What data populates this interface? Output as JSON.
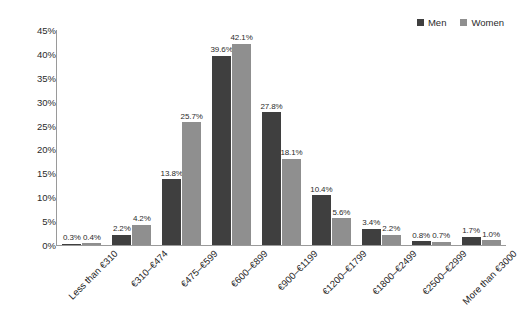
{
  "legend": {
    "position": "top-right",
    "items": [
      {
        "label": "Men",
        "color": "#3f3f3f",
        "swatch_name": "legend-swatch-men"
      },
      {
        "label": "Women",
        "color": "#8f8f8f",
        "swatch_name": "legend-swatch-women"
      }
    ]
  },
  "axis": {
    "y_ticks": [
      "0%",
      "5%",
      "10%",
      "15%",
      "20%",
      "25%",
      "30%",
      "35%",
      "40%",
      "45%"
    ],
    "y_tick_values": [
      0,
      5,
      10,
      15,
      20,
      25,
      30,
      35,
      40,
      45
    ]
  },
  "chart_data": {
    "type": "bar",
    "title": "",
    "subtitle": "",
    "xlabel": "",
    "ylabel": "",
    "ylim": [
      0,
      45
    ],
    "grid": false,
    "legend_position": "top-right",
    "categories": [
      "Less than €310",
      "€310–€474",
      "€475–€599",
      "€600–€899",
      "€900–€1199",
      "€1200–€1799",
      "€1800–€2499",
      "€2500–€2999",
      "More than €3000"
    ],
    "series": [
      {
        "name": "Men",
        "color": "#3f3f3f",
        "values": [
          0.3,
          2.2,
          13.8,
          39.6,
          27.8,
          10.4,
          3.4,
          0.8,
          1.7
        ],
        "labels": [
          "0.3%",
          "2.2%",
          "13.8%",
          "39.6%",
          "27.8%",
          "10.4%",
          "3.4%",
          "0.8%",
          "1.7%"
        ]
      },
      {
        "name": "Women",
        "color": "#8f8f8f",
        "values": [
          0.4,
          4.2,
          25.7,
          42.1,
          18.1,
          5.6,
          2.2,
          0.7,
          1.0
        ],
        "labels": [
          "0.4%",
          "4.2%",
          "25.7%",
          "42.1%",
          "18.1%",
          "5.6%",
          "2.2%",
          "0.7%",
          "1.0%"
        ]
      }
    ]
  }
}
